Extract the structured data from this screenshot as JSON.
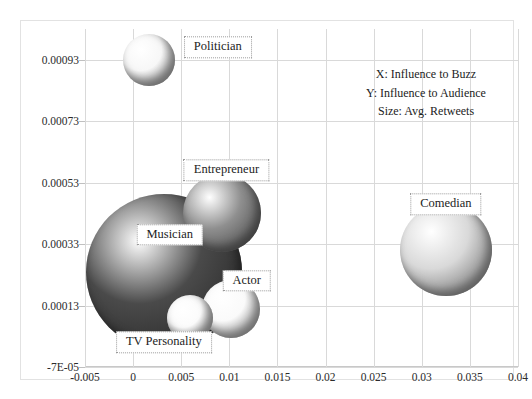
{
  "top_fragment": {
    "text": "a clipped line of text cut off above the chart"
  },
  "chart_data": {
    "type": "scatter",
    "title": "",
    "xlabel": "",
    "ylabel": "",
    "xlim": [
      -0.005,
      0.04
    ],
    "ylim": [
      -7e-05,
      0.00103
    ],
    "grid": true,
    "legend_position": "inside-top-right",
    "annotations": [
      "X: Influence to Buzz",
      "Y: Influence to Audience",
      "Size: Avg. Retweets"
    ],
    "xticks": [
      "-0.005",
      "0",
      "0.005",
      "0.01",
      "0.015",
      "0.02",
      "0.025",
      "0.03",
      "0.035",
      "0.04"
    ],
    "xtick_values": [
      -0.005,
      0,
      0.005,
      0.01,
      0.015,
      0.02,
      0.025,
      0.03,
      0.035,
      0.04
    ],
    "yticks": [
      "-7E-05",
      "0.00013",
      "0.00033",
      "0.00053",
      "0.00073",
      "0.00093"
    ],
    "ytick_values": [
      -7e-05,
      0.00013,
      0.00033,
      0.00053,
      0.00073,
      0.00093
    ],
    "points": [
      {
        "label": "Politician",
        "x": 0.0017,
        "y": 0.00093,
        "size": 26,
        "color": "#f7f7f7",
        "label_x": 0.0088,
        "label_y": 0.00097
      },
      {
        "label": "Entrepreneur",
        "x": 0.0092,
        "y": 0.00043,
        "size": 39,
        "color": "#8f8f8f",
        "label_x": 0.0097,
        "label_y": 0.00057
      },
      {
        "label": "Comedian",
        "x": 0.0325,
        "y": 0.00031,
        "size": 46,
        "color": "#d9d9d9",
        "label_x": 0.0325,
        "label_y": 0.00046
      },
      {
        "label": "Musician",
        "x": 0.0032,
        "y": 0.00024,
        "size": 78,
        "color": "#4a4a4a",
        "label_x": 0.0038,
        "label_y": 0.00036
      },
      {
        "label": "Actor",
        "x": 0.0102,
        "y": 0.00012,
        "size": 29,
        "color": "#fafafa",
        "label_x": 0.0118,
        "label_y": 0.00021
      },
      {
        "label": "TV Personality",
        "x": 0.0059,
        "y": 9e-05,
        "size": 23,
        "color": "#fbfbfb",
        "label_x": 0.0032,
        "label_y": 1e-05
      }
    ]
  },
  "colors": {
    "grid": "#d9d9d9",
    "frame": "#e2e2e2",
    "text": "#1c1c1c",
    "label_border": "#9b9b9b"
  }
}
